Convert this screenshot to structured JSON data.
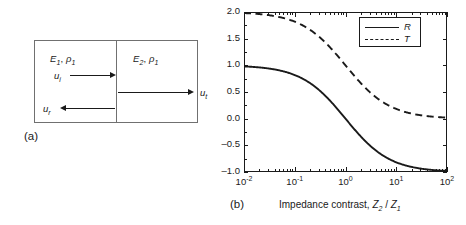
{
  "figure": {
    "panel_a": {
      "label": "(a)",
      "material_left": {
        "modulus": "E",
        "modulus_sub": "1",
        "density": "ρ",
        "density_sub": "1"
      },
      "material_right": {
        "modulus": "E",
        "modulus_sub": "2",
        "density": "ρ",
        "density_sub": "1"
      },
      "waves": [
        {
          "name": "incident",
          "symbol": "u",
          "sub": "i",
          "direction": "right"
        },
        {
          "name": "transmitted",
          "symbol": "u",
          "sub": "t",
          "direction": "right"
        },
        {
          "name": "reflected",
          "symbol": "u",
          "sub": "r",
          "direction": "left"
        }
      ]
    },
    "panel_b": {
      "label": "(b)"
    }
  },
  "chart_data": {
    "type": "line",
    "title": "",
    "xlabel": "Impedance contrast,  Z2 / Z1",
    "xlabel_parts": {
      "text": "Impedance contrast, ",
      "sym1": "Z",
      "sub1": "2",
      "slash": " / ",
      "sym2": "Z",
      "sub2": "1"
    },
    "ylabel": "",
    "xscale": "log",
    "xlim": [
      0.01,
      100
    ],
    "ylim": [
      -1.0,
      2.0
    ],
    "grid": false,
    "xticks": [
      0.01,
      0.1,
      1,
      100,
      10
    ],
    "xtick_labels": [
      "10−2",
      "10−1",
      "10⁰",
      "10¹",
      "10²"
    ],
    "xtick_mantissa": [
      "10",
      "10",
      "10",
      "10",
      "10"
    ],
    "xtick_exponents": [
      "-2",
      "-1",
      "0",
      "1",
      "2"
    ],
    "yticks": [
      2.0,
      1.5,
      1.0,
      0.5,
      0.0,
      -0.5,
      -1.0
    ],
    "ytick_labels": [
      "2.0",
      "1.5",
      "1.0",
      "0.5",
      "0.0",
      "–0.5",
      "–1.0"
    ],
    "legend_position": "upper right",
    "series": [
      {
        "name": "R",
        "legend": "R",
        "style": "solid",
        "color": "#1a1a1a",
        "formula": "(1 - z) / (1 + z)",
        "x": [
          0.01,
          0.02,
          0.04,
          0.07,
          0.1,
          0.2,
          0.4,
          0.7,
          1.0,
          1.5,
          2.0,
          4.0,
          7.0,
          10.0,
          20.0,
          40.0,
          70.0,
          100.0
        ],
        "values": [
          0.98,
          0.961,
          0.923,
          0.869,
          0.818,
          0.667,
          0.429,
          0.176,
          0.0,
          -0.2,
          -0.333,
          -0.6,
          -0.75,
          -0.818,
          -0.905,
          -0.951,
          -0.972,
          -0.98
        ]
      },
      {
        "name": "T",
        "legend": "T",
        "style": "dashed",
        "color": "#1a1a1a",
        "formula": "2 / (1 + z)",
        "x": [
          0.01,
          0.02,
          0.04,
          0.07,
          0.1,
          0.2,
          0.4,
          0.7,
          1.0,
          1.5,
          2.0,
          4.0,
          7.0,
          10.0,
          20.0,
          40.0,
          70.0,
          100.0
        ],
        "values": [
          1.98,
          1.961,
          1.923,
          1.869,
          1.818,
          1.667,
          1.429,
          1.176,
          1.0,
          0.8,
          0.667,
          0.4,
          0.25,
          0.182,
          0.095,
          0.049,
          0.028,
          0.02
        ]
      }
    ]
  }
}
